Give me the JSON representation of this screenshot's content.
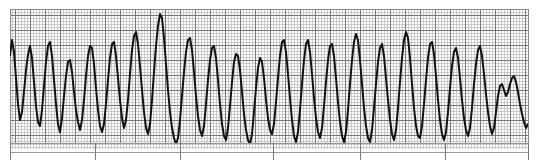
{
  "document": {
    "title": "ECG Rhythm Strip",
    "kind": "electrocardiogram-tracing",
    "description": "Monochrome printed ECG rhythm strip on graph paper showing a wide-complex, rapid, sawtooth-like tachyarrhythmia (ventricular tachycardia / ventricular flutter morphology) that coarsens and slows toward the right end of the strip.",
    "alt_text": "ECG rhythm strip: rapid wide-complex sawtooth waveform on grey graph paper"
  },
  "colors": {
    "page_background": "#ffffff",
    "paper_background": "#fdfdfd",
    "grid_fine": "#b9b9b9",
    "grid_major": "#6e6e6e",
    "plot_border": "#8a8a8a",
    "trace": "#111111",
    "tick_mark": "#7a7a7a",
    "baseline_rule": "#9a9a9a"
  },
  "layout": {
    "image_width": 539,
    "image_height": 164,
    "plot_left": 10,
    "plot_top": 9,
    "plot_right": 528,
    "plot_bottom": 143,
    "plot_width": 518,
    "plot_height": 134,
    "grid_fine_spacing": 3,
    "grid_major_spacing": 15,
    "baseline_rule_y": 152,
    "tick_bottom_y": 160
  },
  "annotations": {
    "time_tick_positions_px": [
      10,
      95,
      180,
      273,
      360,
      445,
      528
    ],
    "major_horizontal_lines_px": [
      9,
      24,
      39,
      54,
      69,
      84,
      99,
      114,
      129,
      143
    ],
    "labels": [],
    "calibration_marks": []
  },
  "chart_data": {
    "type": "line",
    "title": "ECG Rhythm Strip",
    "subtitle": "",
    "xlabel": "",
    "ylabel": "",
    "grid": true,
    "legend_position": "none",
    "xlim": [
      10,
      528
    ],
    "ylim": [
      143,
      9
    ],
    "axis_inverted_y": true,
    "series": [
      {
        "name": "ecg-lead-trace",
        "color": "#111111",
        "line_width": 2.0,
        "points": [
          [
            10,
            55
          ],
          [
            12,
            40
          ],
          [
            14,
            52
          ],
          [
            16,
            78
          ],
          [
            18,
            104
          ],
          [
            20,
            120
          ],
          [
            22,
            112
          ],
          [
            24,
            92
          ],
          [
            26,
            70
          ],
          [
            28,
            55
          ],
          [
            30,
            46
          ],
          [
            32,
            58
          ],
          [
            34,
            82
          ],
          [
            36,
            106
          ],
          [
            38,
            122
          ],
          [
            40,
            126
          ],
          [
            42,
            110
          ],
          [
            44,
            86
          ],
          [
            46,
            62
          ],
          [
            48,
            46
          ],
          [
            50,
            42
          ],
          [
            52,
            56
          ],
          [
            54,
            80
          ],
          [
            56,
            104
          ],
          [
            58,
            124
          ],
          [
            60,
            132
          ],
          [
            62,
            118
          ],
          [
            64,
            96
          ],
          [
            66,
            76
          ],
          [
            68,
            62
          ],
          [
            70,
            60
          ],
          [
            72,
            72
          ],
          [
            74,
            92
          ],
          [
            76,
            110
          ],
          [
            78,
            122
          ],
          [
            80,
            130
          ],
          [
            82,
            120
          ],
          [
            84,
            100
          ],
          [
            86,
            76
          ],
          [
            88,
            56
          ],
          [
            90,
            46
          ],
          [
            92,
            48
          ],
          [
            94,
            64
          ],
          [
            96,
            88
          ],
          [
            98,
            110
          ],
          [
            100,
            126
          ],
          [
            102,
            132
          ],
          [
            104,
            124
          ],
          [
            106,
            104
          ],
          [
            108,
            80
          ],
          [
            110,
            58
          ],
          [
            112,
            44
          ],
          [
            114,
            42
          ],
          [
            116,
            56
          ],
          [
            118,
            78
          ],
          [
            120,
            100
          ],
          [
            122,
            118
          ],
          [
            124,
            128
          ],
          [
            126,
            120
          ],
          [
            128,
            100
          ],
          [
            130,
            74
          ],
          [
            132,
            50
          ],
          [
            134,
            36
          ],
          [
            136,
            32
          ],
          [
            138,
            44
          ],
          [
            140,
            66
          ],
          [
            142,
            90
          ],
          [
            144,
            112
          ],
          [
            146,
            128
          ],
          [
            148,
            134
          ],
          [
            150,
            124
          ],
          [
            152,
            100
          ],
          [
            154,
            72
          ],
          [
            156,
            46
          ],
          [
            158,
            26
          ],
          [
            160,
            14
          ],
          [
            162,
            18
          ],
          [
            164,
            38
          ],
          [
            166,
            64
          ],
          [
            168,
            90
          ],
          [
            170,
            112
          ],
          [
            172,
            128
          ],
          [
            174,
            138
          ],
          [
            176,
            144
          ],
          [
            178,
            138
          ],
          [
            180,
            120
          ],
          [
            182,
            96
          ],
          [
            184,
            72
          ],
          [
            186,
            52
          ],
          [
            188,
            40
          ],
          [
            190,
            38
          ],
          [
            192,
            50
          ],
          [
            194,
            72
          ],
          [
            196,
            96
          ],
          [
            198,
            116
          ],
          [
            200,
            130
          ],
          [
            202,
            136
          ],
          [
            204,
            126
          ],
          [
            206,
            104
          ],
          [
            208,
            80
          ],
          [
            210,
            60
          ],
          [
            212,
            48
          ],
          [
            214,
            46
          ],
          [
            216,
            58
          ],
          [
            218,
            80
          ],
          [
            220,
            104
          ],
          [
            222,
            124
          ],
          [
            224,
            136
          ],
          [
            226,
            140
          ],
          [
            228,
            128
          ],
          [
            230,
            106
          ],
          [
            232,
            82
          ],
          [
            234,
            62
          ],
          [
            236,
            54
          ],
          [
            238,
            56
          ],
          [
            240,
            70
          ],
          [
            242,
            92
          ],
          [
            244,
            114
          ],
          [
            246,
            130
          ],
          [
            248,
            140
          ],
          [
            250,
            144
          ],
          [
            252,
            134
          ],
          [
            254,
            112
          ],
          [
            256,
            88
          ],
          [
            258,
            68
          ],
          [
            260,
            58
          ],
          [
            262,
            62
          ],
          [
            264,
            78
          ],
          [
            266,
            100
          ],
          [
            268,
            118
          ],
          [
            270,
            130
          ],
          [
            272,
            134
          ],
          [
            274,
            124
          ],
          [
            276,
            102
          ],
          [
            278,
            78
          ],
          [
            280,
            56
          ],
          [
            282,
            42
          ],
          [
            284,
            40
          ],
          [
            286,
            52
          ],
          [
            288,
            74
          ],
          [
            290,
            98
          ],
          [
            292,
            120
          ],
          [
            294,
            136
          ],
          [
            296,
            142
          ],
          [
            298,
            132
          ],
          [
            300,
            110
          ],
          [
            302,
            84
          ],
          [
            304,
            60
          ],
          [
            306,
            44
          ],
          [
            308,
            40
          ],
          [
            310,
            52
          ],
          [
            312,
            74
          ],
          [
            314,
            98
          ],
          [
            316,
            118
          ],
          [
            318,
            132
          ],
          [
            320,
            138
          ],
          [
            322,
            128
          ],
          [
            324,
            106
          ],
          [
            326,
            82
          ],
          [
            328,
            60
          ],
          [
            330,
            46
          ],
          [
            332,
            44
          ],
          [
            334,
            56
          ],
          [
            336,
            78
          ],
          [
            338,
            102
          ],
          [
            340,
            122
          ],
          [
            342,
            136
          ],
          [
            344,
            142
          ],
          [
            346,
            132
          ],
          [
            348,
            110
          ],
          [
            350,
            84
          ],
          [
            352,
            60
          ],
          [
            354,
            42
          ],
          [
            356,
            34
          ],
          [
            358,
            40
          ],
          [
            360,
            60
          ],
          [
            362,
            84
          ],
          [
            364,
            108
          ],
          [
            366,
            126
          ],
          [
            368,
            138
          ],
          [
            370,
            142
          ],
          [
            372,
            130
          ],
          [
            374,
            108
          ],
          [
            376,
            84
          ],
          [
            378,
            62
          ],
          [
            380,
            48
          ],
          [
            382,
            44
          ],
          [
            384,
            56
          ],
          [
            386,
            78
          ],
          [
            388,
            100
          ],
          [
            390,
            120
          ],
          [
            392,
            134
          ],
          [
            394,
            140
          ],
          [
            396,
            130
          ],
          [
            398,
            108
          ],
          [
            400,
            82
          ],
          [
            402,
            58
          ],
          [
            404,
            40
          ],
          [
            406,
            32
          ],
          [
            408,
            38
          ],
          [
            410,
            58
          ],
          [
            412,
            84
          ],
          [
            414,
            108
          ],
          [
            416,
            126
          ],
          [
            418,
            136
          ],
          [
            420,
            138
          ],
          [
            422,
            126
          ],
          [
            424,
            104
          ],
          [
            426,
            80
          ],
          [
            428,
            58
          ],
          [
            430,
            44
          ],
          [
            432,
            42
          ],
          [
            434,
            54
          ],
          [
            436,
            76
          ],
          [
            438,
            100
          ],
          [
            440,
            120
          ],
          [
            442,
            134
          ],
          [
            444,
            140
          ],
          [
            446,
            132
          ],
          [
            448,
            112
          ],
          [
            450,
            88
          ],
          [
            452,
            66
          ],
          [
            454,
            52
          ],
          [
            456,
            48
          ],
          [
            458,
            58
          ],
          [
            460,
            78
          ],
          [
            462,
            100
          ],
          [
            464,
            118
          ],
          [
            466,
            130
          ],
          [
            468,
            136
          ],
          [
            470,
            128
          ],
          [
            472,
            108
          ],
          [
            474,
            84
          ],
          [
            476,
            64
          ],
          [
            478,
            50
          ],
          [
            480,
            46
          ],
          [
            482,
            56
          ],
          [
            484,
            74
          ],
          [
            486,
            94
          ],
          [
            488,
            112
          ],
          [
            490,
            126
          ],
          [
            492,
            134
          ],
          [
            494,
            128
          ],
          [
            496,
            112
          ],
          [
            498,
            96
          ],
          [
            500,
            86
          ],
          [
            502,
            84
          ],
          [
            504,
            90
          ],
          [
            506,
            96
          ],
          [
            508,
            92
          ],
          [
            510,
            84
          ],
          [
            512,
            78
          ],
          [
            514,
            76
          ],
          [
            516,
            82
          ],
          [
            518,
            92
          ],
          [
            520,
            104
          ],
          [
            522,
            114
          ],
          [
            524,
            122
          ],
          [
            526,
            128
          ],
          [
            528,
            124
          ]
        ]
      }
    ]
  }
}
